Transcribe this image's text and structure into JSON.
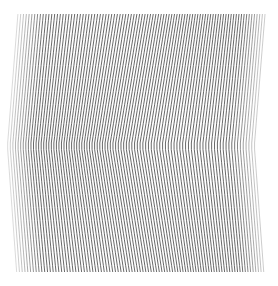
{
  "artwork": {
    "type": "op-art line moire",
    "background": "#ffffff",
    "stroke_color": "#3a3a3a",
    "bounds": {
      "x0": 15,
      "x1": 262,
      "y0": 14,
      "y1": 272
    },
    "line_count": 92,
    "stroke_width": 0.9,
    "apex": {
      "x": 140,
      "y": 146
    },
    "top_lean": 14,
    "bottom_lean": 12,
    "bow_depth": 16,
    "edge_fade": true
  }
}
